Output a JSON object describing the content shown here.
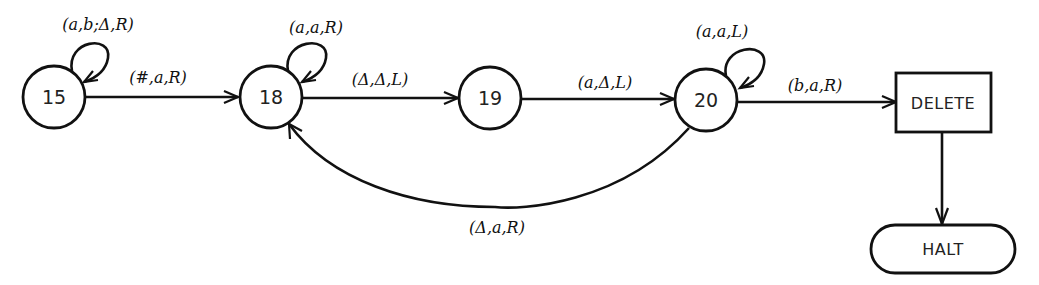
{
  "diagram": {
    "type": "turing-machine-state-diagram",
    "states": [
      {
        "id": "15",
        "label": "15",
        "shape": "circle"
      },
      {
        "id": "18",
        "label": "18",
        "shape": "circle"
      },
      {
        "id": "19",
        "label": "19",
        "shape": "circle"
      },
      {
        "id": "20",
        "label": "20",
        "shape": "circle"
      },
      {
        "id": "delete",
        "label": "DELETE",
        "shape": "rectangle"
      },
      {
        "id": "halt",
        "label": "HALT",
        "shape": "rounded-pill"
      }
    ],
    "transitions": [
      {
        "id": "loop15",
        "from": "15",
        "to": "15",
        "label": "(a,b;Δ,R)"
      },
      {
        "id": "t15_18",
        "from": "15",
        "to": "18",
        "label": "(#,a,R)"
      },
      {
        "id": "loop18",
        "from": "18",
        "to": "18",
        "label": "(a,a,R)"
      },
      {
        "id": "t18_19",
        "from": "18",
        "to": "19",
        "label": "(Δ,Δ,L)"
      },
      {
        "id": "t19_20",
        "from": "19",
        "to": "20",
        "label": "(a,Δ,L)"
      },
      {
        "id": "loop20",
        "from": "20",
        "to": "20",
        "label": "(a,a,L)"
      },
      {
        "id": "t20_delete",
        "from": "20",
        "to": "delete",
        "label": "(b,a,R)"
      },
      {
        "id": "t20_18",
        "from": "20",
        "to": "18",
        "label": "(Δ,a,R)"
      },
      {
        "id": "t_delete_halt",
        "from": "delete",
        "to": "halt",
        "label": ""
      }
    ]
  }
}
